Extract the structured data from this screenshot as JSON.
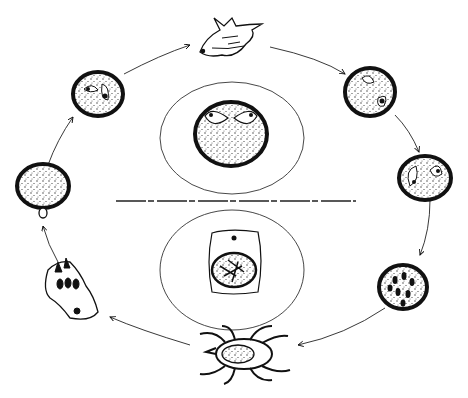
{
  "diagram": {
    "type": "life-cycle",
    "colors": {
      "ink": "#111111",
      "background": "#ffffff",
      "stipple": "#333333"
    },
    "center_top": {
      "name": "erythrocyte-with-paired-pyriform-parasites"
    },
    "center_bottom": {
      "name": "tick-gut-cell-with-developing-parasites"
    },
    "divider": {
      "name": "host-vector-divider"
    },
    "stages": [
      {
        "id": 1,
        "name": "mammal-host-head",
        "position": "top"
      },
      {
        "id": 2,
        "name": "erythrocyte-two-parasites",
        "position": "upper-right"
      },
      {
        "id": 3,
        "name": "erythrocyte-dividing-pyriform",
        "position": "right"
      },
      {
        "id": 4,
        "name": "erythrocyte-multiple-merozoites",
        "position": "lower-right"
      },
      {
        "id": 5,
        "name": "tick-vector",
        "position": "bottom"
      },
      {
        "id": 6,
        "name": "salivary-gland-sporozoites",
        "position": "lower-left"
      },
      {
        "id": 7,
        "name": "erythrocyte-entry",
        "position": "left"
      },
      {
        "id": 8,
        "name": "erythrocyte-paired-parasites",
        "position": "upper-left"
      }
    ],
    "flow": "clockwise"
  }
}
